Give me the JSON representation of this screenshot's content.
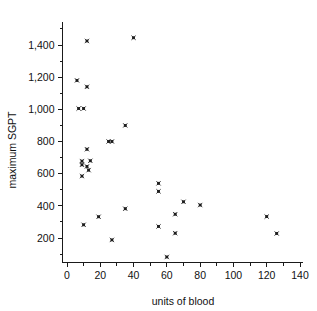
{
  "chart_data": {
    "type": "scatter",
    "title": "",
    "xlabel": "units of blood",
    "ylabel": "maximum SGPT",
    "xlim": [
      -7,
      147
    ],
    "ylim": [
      0,
      1520
    ],
    "grid": false,
    "legend": "none",
    "marker_style": "x-cross",
    "marker_color": "#1a1a1a",
    "xticks": [
      0,
      20,
      40,
      60,
      80,
      100,
      120,
      140
    ],
    "xtick_labels": [
      "0",
      "20",
      "40",
      "60",
      "80",
      "100",
      "120",
      "140"
    ],
    "xminor_step": 10,
    "yticks": [
      200,
      400,
      600,
      800,
      1000,
      1200,
      1400
    ],
    "ytick_labels": [
      "200",
      "400",
      "600",
      "800",
      "1,000",
      "1,200",
      "1,400"
    ],
    "yminor_step": 100,
    "points": [
      {
        "x": 6,
        "y": 1180
      },
      {
        "x": 12,
        "y": 1140
      },
      {
        "x": 7,
        "y": 1005
      },
      {
        "x": 10,
        "y": 1005
      },
      {
        "x": 12,
        "y": 1425
      },
      {
        "x": 40,
        "y": 1445
      },
      {
        "x": 35,
        "y": 900
      },
      {
        "x": 25,
        "y": 800
      },
      {
        "x": 27,
        "y": 800
      },
      {
        "x": 12,
        "y": 752
      },
      {
        "x": 9,
        "y": 678
      },
      {
        "x": 14,
        "y": 680
      },
      {
        "x": 9,
        "y": 655
      },
      {
        "x": 12,
        "y": 645
      },
      {
        "x": 13,
        "y": 622
      },
      {
        "x": 9,
        "y": 585
      },
      {
        "x": 55,
        "y": 540
      },
      {
        "x": 55,
        "y": 490
      },
      {
        "x": 70,
        "y": 425
      },
      {
        "x": 80,
        "y": 405
      },
      {
        "x": 35,
        "y": 382
      },
      {
        "x": 65,
        "y": 348
      },
      {
        "x": 120,
        "y": 333
      },
      {
        "x": 19,
        "y": 332
      },
      {
        "x": 10,
        "y": 282
      },
      {
        "x": 55,
        "y": 272
      },
      {
        "x": 65,
        "y": 230
      },
      {
        "x": 126,
        "y": 228
      },
      {
        "x": 27,
        "y": 188
      },
      {
        "x": 60,
        "y": 82
      }
    ]
  }
}
